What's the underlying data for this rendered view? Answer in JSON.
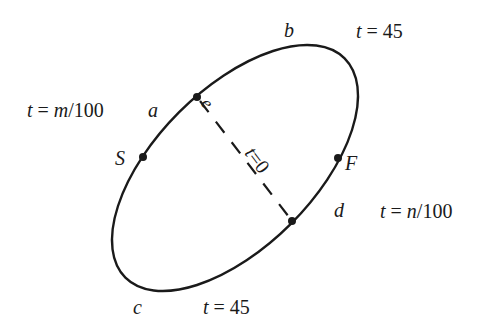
{
  "diagram": {
    "curve": {
      "stroke": "#1a1a1a",
      "center": [
        235,
        168
      ],
      "rx": 155,
      "ry": 79,
      "rotation": -45
    },
    "points": [
      {
        "id": "e",
        "label": "e",
        "x": 197,
        "y": 97
      },
      {
        "id": "S",
        "label": "S",
        "x": 143,
        "y": 157
      },
      {
        "id": "F",
        "label": "F",
        "x": 338,
        "y": 158
      },
      {
        "id": "d",
        "label": "d",
        "x": 292,
        "y": 221
      }
    ],
    "arc_labels": {
      "a": "a",
      "b": "b",
      "c": "c",
      "d": "d",
      "e": "e"
    },
    "vertex_labels": {
      "S": "S",
      "F": "F"
    },
    "chord": {
      "from": "e",
      "to": "d",
      "style": "dashed",
      "label": "t=0"
    },
    "time_labels": {
      "top_right": {
        "var": "t",
        "eq": " = ",
        "val": "45"
      },
      "bottom": {
        "var": "t",
        "eq": " = ",
        "val": "45"
      },
      "left": {
        "var": "t",
        "eq": " = ",
        "num_var": "m",
        "den": "/100"
      },
      "right": {
        "var": "t",
        "eq": " = ",
        "num_var": "n",
        "den": "/100"
      }
    }
  }
}
